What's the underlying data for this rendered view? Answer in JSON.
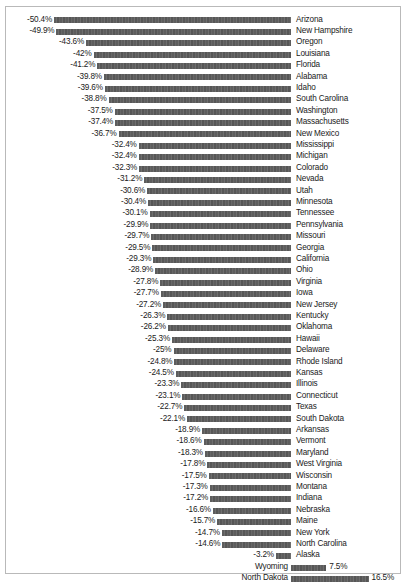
{
  "chart_data": {
    "type": "bar",
    "orientation": "horizontal",
    "title": "",
    "subtitle": "",
    "xlabel": "",
    "ylabel": "",
    "xlim": [
      -50.4,
      16.5
    ],
    "grid": false,
    "legend": null,
    "zero_axis": true,
    "value_suffix": "%",
    "categories": [
      "Arizona",
      "New Hampshire",
      "Oregon",
      "Louisiana",
      "Florida",
      "Alabama",
      "Idaho",
      "South Carolina",
      "Washington",
      "Massachusetts",
      "New Mexico",
      "Mississippi",
      "Michigan",
      "Colorado",
      "Nevada",
      "Utah",
      "Minnesota",
      "Tennessee",
      "Pennsylvania",
      "Missouri",
      "Georgia",
      "California",
      "Ohio",
      "Virginia",
      "Iowa",
      "New Jersey",
      "Kentucky",
      "Oklahoma",
      "Hawaii",
      "Delaware",
      "Rhode Island",
      "Kansas",
      "Illinois",
      "Connecticut",
      "Texas",
      "South Dakota",
      "Arkansas",
      "Vermont",
      "Maryland",
      "West Virginia",
      "Wisconsin",
      "Montana",
      "Indiana",
      "Nebraska",
      "Maine",
      "New York",
      "North Carolina",
      "Alaska",
      "Wyoming",
      "North Dakota"
    ],
    "values": [
      -50.4,
      -49.9,
      -43.6,
      -42,
      -41.2,
      -39.8,
      -39.6,
      -38.8,
      -37.5,
      -37.4,
      -36.7,
      -32.4,
      -32.4,
      -32.3,
      -31.2,
      -30.6,
      -30.4,
      -30.1,
      -29.9,
      -29.7,
      -29.5,
      -29.3,
      -28.9,
      -27.8,
      -27.7,
      -27.2,
      -26.3,
      -26.2,
      -25.3,
      -25,
      -24.8,
      -24.5,
      -23.3,
      -23.1,
      -22.7,
      -22.1,
      -18.9,
      -18.6,
      -18.3,
      -17.8,
      -17.5,
      -17.3,
      -17.2,
      -16.6,
      -15.7,
      -14.7,
      -14.6,
      -3.2,
      7.5,
      16.5
    ],
    "value_labels": [
      "-50.4%",
      "-49.9%",
      "-43.6%",
      "-42%",
      "-41.2%",
      "-39.8%",
      "-39.6%",
      "-38.8%",
      "-37.5%",
      "-37.4%",
      "-36.7%",
      "-32.4%",
      "-32.4%",
      "-32.3%",
      "-31.2%",
      "-30.6%",
      "-30.4%",
      "-30.1%",
      "-29.9%",
      "-29.7%",
      "-29.5%",
      "-29.3%",
      "-28.9%",
      "-27.8%",
      "-27.7%",
      "-27.2%",
      "-26.3%",
      "-26.2%",
      "-25.3%",
      "-25%",
      "-24.8%",
      "-24.5%",
      "-23.3%",
      "-23.1%",
      "-22.7%",
      "-22.1%",
      "-18.9%",
      "-18.6%",
      "-18.3%",
      "-17.8%",
      "-17.5%",
      "-17.3%",
      "-17.2%",
      "-16.6%",
      "-15.7%",
      "-14.7%",
      "-14.6%",
      "-3.2%",
      "7.5%",
      "16.5%"
    ],
    "bar_color": "#5f5f5f",
    "text_color": "#1a1a1a",
    "border_color": "#b9b9b9"
  },
  "layout": {
    "zero_axis_x": 290,
    "px_per_percent": 4.7,
    "row_height": 11.4,
    "first_row_top": 8,
    "bar_thickness": 6
  }
}
